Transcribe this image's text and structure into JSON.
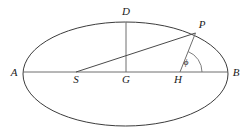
{
  "figure": {
    "type": "geometry-diagram",
    "background_color": "#ffffff",
    "stroke_color": "#3c3c3c",
    "label_color": "#1a1a1a"
  },
  "ellipse": {
    "center_x": 125.5,
    "center_y": 74,
    "semi_major_axis": 102.5,
    "semi_minor_axis": 52,
    "stroke_width": 1.0
  },
  "points": [
    {
      "id": "A",
      "label": "A",
      "x": 23,
      "y": 72,
      "label_x": 14,
      "label_y": 73
    },
    {
      "id": "S",
      "label": "S",
      "x": 76,
      "y": 72,
      "label_x": 76,
      "label_y": 80
    },
    {
      "id": "G",
      "label": "G",
      "x": 126,
      "y": 72,
      "label_x": 126,
      "label_y": 80
    },
    {
      "id": "H",
      "label": "H",
      "x": 180,
      "y": 72,
      "label_x": 178,
      "label_y": 80
    },
    {
      "id": "B",
      "label": "B",
      "x": 228,
      "y": 72,
      "label_x": 236,
      "label_y": 73
    },
    {
      "id": "D",
      "label": "D",
      "x": 126,
      "y": 22,
      "label_x": 126,
      "label_y": 12
    },
    {
      "id": "P",
      "label": "P",
      "x": 195.5,
      "y": 33,
      "label_x": 202,
      "label_y": 25
    }
  ],
  "segments": [
    {
      "id": "major-axis",
      "from": "A",
      "to": "B",
      "x1": 23,
      "y1": 72,
      "x2": 228,
      "y2": 72
    },
    {
      "id": "semi-minor-axis-DG",
      "from": "D",
      "to": "G",
      "x1": 126,
      "y1": 22,
      "x2": 126,
      "y2": 72
    },
    {
      "id": "radius-vector-SP",
      "from": "S",
      "to": "P",
      "x1": 76,
      "y1": 72,
      "x2": 195.5,
      "y2": 33
    },
    {
      "id": "segment-HP",
      "from": "H",
      "to": "P",
      "x1": 180,
      "y1": 72,
      "x2": 195.5,
      "y2": 33
    }
  ],
  "angle": {
    "id": "phi",
    "symbol": "ϕ",
    "vertex": "H",
    "between": [
      "HP",
      "HB"
    ],
    "arc_radius": 22,
    "label_x": 186,
    "label_y": 63
  }
}
